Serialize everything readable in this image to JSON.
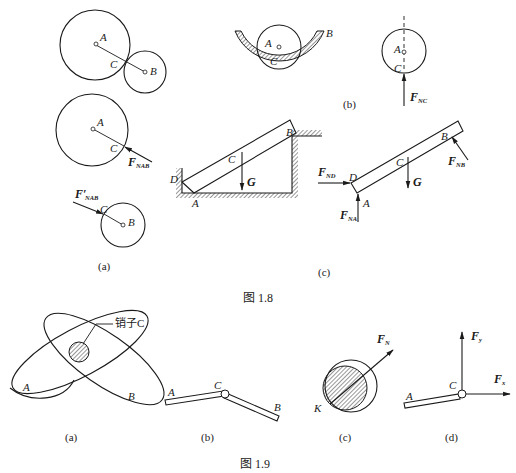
{
  "figure_1_8": {
    "caption": "图 1.8",
    "panel_a": {
      "label": "(a)",
      "top": {
        "A": "A",
        "B": "B",
        "C": "C"
      },
      "middle": {
        "A": "A",
        "C": "C",
        "force": "F",
        "force_sub": "NAB"
      },
      "bottom": {
        "B": "B",
        "C": "C",
        "force": "F′",
        "force_sub": "NAB"
      }
    },
    "panel_b": {
      "label": "(b)",
      "left": {
        "A": "A",
        "B": "B",
        "C": "C"
      },
      "right": {
        "A": "A",
        "C": "C",
        "force": "F",
        "force_sub": "NC"
      }
    },
    "panel_c": {
      "label": "(c)",
      "left": {
        "A": "A",
        "B": "B",
        "C": "C",
        "D": "D",
        "G": "G"
      },
      "right": {
        "A": "A",
        "B": "B",
        "C": "C",
        "D": "D",
        "G": "G",
        "F_ND": "F",
        "F_ND_sub": "ND",
        "F_NA": "F",
        "F_NA_sub": "NA",
        "F_NB": "F",
        "F_NB_sub": "NB"
      }
    }
  },
  "figure_1_9": {
    "caption": "图 1.9",
    "panel_a": {
      "label": "(a)",
      "A": "A",
      "B": "B",
      "pin_label": "销子C"
    },
    "panel_b": {
      "label": "(b)",
      "A": "A",
      "B": "B",
      "C": "C"
    },
    "panel_c": {
      "label": "(c)",
      "K": "K",
      "force": "F",
      "force_sub": "N"
    },
    "panel_d": {
      "label": "(d)",
      "A": "A",
      "C": "C",
      "Fy": "F",
      "Fy_sub": "y",
      "Fx": "F",
      "Fx_sub": "x"
    }
  }
}
